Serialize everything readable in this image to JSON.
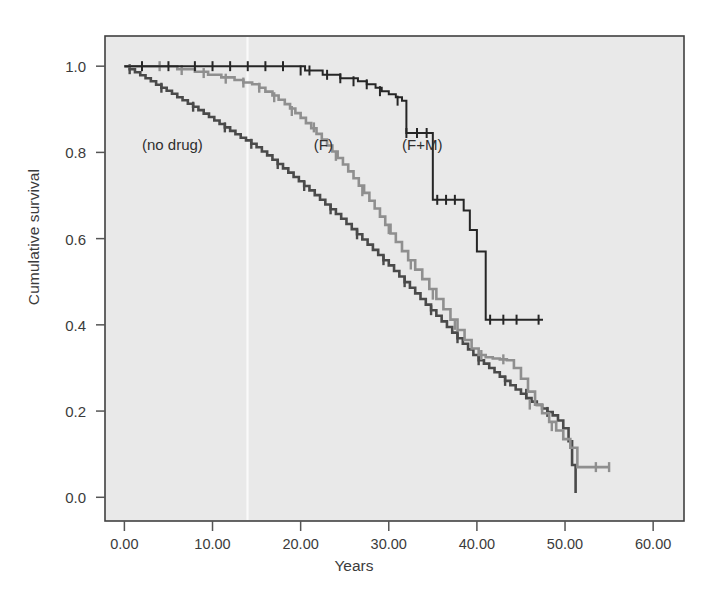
{
  "figure": {
    "axis_x_label": "Years",
    "axis_y_label": "Cumulative survival",
    "caption": "Fig. 12.2  Kaplan-Meier survival curves",
    "plot_background": "#e9e9e9",
    "border_color": "#404040"
  },
  "labels": {
    "no_drug": "(no drug)",
    "f": "(F)",
    "fm": "(F+M)"
  },
  "xticks": [
    "0.00",
    "10.00",
    "20.00",
    "30.00",
    "40.00",
    "50.00",
    "60.00"
  ],
  "yticks": [
    "1.0",
    "0.8",
    "0.6",
    "0.4",
    "0.2",
    "0.0"
  ],
  "chart_data": {
    "type": "line",
    "title": "",
    "subtitle": "",
    "xlabel": "Years",
    "ylabel": "Cumulative survival",
    "xlim": [
      -2.2,
      63.5
    ],
    "ylim": [
      -0.055,
      1.07
    ],
    "xticks": [
      0,
      10,
      20,
      30,
      40,
      50,
      60
    ],
    "xtick_labels": [
      "0.00",
      "10.00",
      "20.00",
      "30.00",
      "40.00",
      "50.00",
      "60.00"
    ],
    "yticks": [
      0.0,
      0.2,
      0.4,
      0.6,
      0.8,
      1.0
    ],
    "ytick_labels": [
      "0.0",
      "0.2",
      "0.4",
      "0.6",
      "0.8",
      "1.0"
    ],
    "grid": false,
    "legend": "inline-annotations",
    "step_style": "post",
    "series": [
      {
        "name": "(no drug)",
        "color": "#4a4a4a",
        "annotation_xy": [
          2.0,
          0.815
        ],
        "x": [
          0.0,
          0.6,
          1.2,
          1.8,
          2.4,
          3.0,
          3.6,
          4.2,
          4.8,
          5.4,
          6.0,
          6.6,
          7.2,
          7.8,
          8.4,
          9.0,
          9.6,
          10.2,
          10.8,
          11.4,
          12.0,
          12.6,
          13.2,
          13.8,
          14.4,
          15.0,
          15.6,
          16.2,
          16.8,
          17.4,
          18.0,
          18.6,
          19.2,
          19.8,
          20.4,
          21.0,
          21.6,
          22.2,
          22.8,
          23.4,
          24.0,
          24.6,
          25.2,
          25.8,
          26.4,
          27.0,
          27.6,
          28.2,
          28.8,
          29.4,
          30.0,
          30.6,
          31.2,
          31.8,
          32.4,
          33.0,
          33.6,
          34.2,
          34.8,
          35.4,
          36.0,
          36.6,
          37.2,
          37.8,
          38.4,
          39.0,
          39.6,
          40.2,
          40.8,
          41.4,
          42.0,
          42.6,
          43.2,
          43.8,
          44.4,
          45.0,
          45.6,
          46.2,
          46.8,
          47.4,
          48.0,
          48.6,
          49.2,
          49.8,
          50.4,
          50.8,
          51.2
        ],
        "y": [
          1.0,
          0.993,
          0.986,
          0.979,
          0.972,
          0.965,
          0.957,
          0.95,
          0.943,
          0.936,
          0.928,
          0.921,
          0.913,
          0.906,
          0.898,
          0.89,
          0.882,
          0.874,
          0.866,
          0.858,
          0.85,
          0.842,
          0.834,
          0.828,
          0.82,
          0.812,
          0.802,
          0.793,
          0.783,
          0.773,
          0.763,
          0.753,
          0.743,
          0.733,
          0.722,
          0.712,
          0.701,
          0.69,
          0.679,
          0.668,
          0.657,
          0.646,
          0.634,
          0.622,
          0.61,
          0.598,
          0.586,
          0.574,
          0.562,
          0.55,
          0.538,
          0.525,
          0.512,
          0.499,
          0.486,
          0.473,
          0.46,
          0.447,
          0.434,
          0.421,
          0.408,
          0.395,
          0.382,
          0.369,
          0.356,
          0.343,
          0.33,
          0.318,
          0.31,
          0.3,
          0.29,
          0.28,
          0.27,
          0.26,
          0.25,
          0.24,
          0.23,
          0.222,
          0.214,
          0.206,
          0.198,
          0.19,
          0.178,
          0.16,
          0.13,
          0.075,
          0.01
        ],
        "censor_x": [
          0.6,
          4.2,
          7.8,
          11.4,
          14.4,
          17.4,
          20.4,
          23.4,
          26.4,
          29.4,
          31.8,
          34.8,
          37.8,
          40.2,
          43.2,
          45.6,
          48.0
        ],
        "censor_y": [
          0.993,
          0.95,
          0.906,
          0.858,
          0.82,
          0.773,
          0.722,
          0.668,
          0.61,
          0.55,
          0.499,
          0.434,
          0.369,
          0.318,
          0.27,
          0.24,
          0.198
        ]
      },
      {
        "name": "(F)",
        "color": "#8f8f8f",
        "annotation_xy": [
          21.5,
          0.815
        ],
        "x": [
          0.0,
          4.0,
          6.0,
          8.0,
          9.5,
          11.0,
          12.5,
          13.5,
          14.5,
          15.3,
          16.0,
          16.8,
          17.5,
          18.2,
          18.8,
          19.4,
          20.0,
          20.6,
          21.2,
          21.8,
          22.4,
          23.0,
          23.6,
          24.2,
          24.8,
          25.4,
          26.0,
          26.6,
          27.2,
          27.8,
          28.4,
          29.0,
          29.6,
          30.2,
          30.8,
          31.5,
          32.2,
          33.0,
          33.8,
          34.6,
          35.4,
          36.2,
          37.0,
          37.8,
          38.6,
          39.4,
          40.2,
          41.0,
          41.8,
          42.6,
          43.4,
          44.2,
          45.0,
          45.8,
          46.6,
          47.4,
          48.2,
          49.0,
          49.8,
          50.6,
          51.4,
          55.0
        ],
        "y": [
          1.0,
          1.0,
          0.993,
          0.987,
          0.98,
          0.974,
          0.968,
          0.962,
          0.958,
          0.95,
          0.941,
          0.932,
          0.922,
          0.912,
          0.902,
          0.891,
          0.88,
          0.868,
          0.856,
          0.843,
          0.83,
          0.816,
          0.802,
          0.787,
          0.772,
          0.756,
          0.74,
          0.723,
          0.706,
          0.688,
          0.67,
          0.651,
          0.632,
          0.612,
          0.592,
          0.571,
          0.55,
          0.528,
          0.506,
          0.483,
          0.46,
          0.436,
          0.412,
          0.388,
          0.365,
          0.345,
          0.33,
          0.325,
          0.322,
          0.32,
          0.318,
          0.3,
          0.275,
          0.245,
          0.215,
          0.195,
          0.175,
          0.155,
          0.135,
          0.115,
          0.07,
          0.07
        ],
        "censor_x": [
          4.0,
          6.5,
          9.0,
          11.5,
          13.5,
          15.3,
          17.0,
          19.0,
          21.5,
          24.0,
          27.0,
          30.0,
          32.5,
          35.0,
          37.5,
          40.5,
          43.0,
          46.0,
          48.5,
          53.5,
          55.0
        ],
        "censor_y": [
          1.0,
          0.991,
          0.984,
          0.971,
          0.962,
          0.95,
          0.928,
          0.896,
          0.858,
          0.792,
          0.71,
          0.622,
          0.54,
          0.47,
          0.4,
          0.33,
          0.32,
          0.215,
          0.165,
          0.07,
          0.07
        ]
      },
      {
        "name": "(F+M)",
        "color": "#262626",
        "annotation_xy": [
          31.5,
          0.815
        ],
        "x": [
          0.0,
          5.0,
          8.0,
          11.0,
          13.0,
          15.0,
          17.0,
          19.0,
          20.5,
          21.5,
          22.5,
          23.5,
          24.5,
          25.5,
          26.5,
          27.5,
          28.5,
          29.2,
          30.0,
          30.8,
          31.5,
          32.0,
          32.5,
          33.0,
          33.5,
          34.0,
          35.0,
          36.0,
          37.0,
          37.8,
          38.5,
          39.2,
          40.0,
          41.0,
          43.0,
          45.0,
          47.5
        ],
        "y": [
          1.0,
          1.0,
          1.0,
          1.0,
          1.0,
          1.0,
          1.0,
          1.0,
          0.99,
          0.99,
          0.98,
          0.98,
          0.972,
          0.972,
          0.965,
          0.958,
          0.95,
          0.942,
          0.935,
          0.928,
          0.92,
          0.845,
          0.845,
          0.845,
          0.845,
          0.845,
          0.69,
          0.69,
          0.69,
          0.69,
          0.665,
          0.62,
          0.57,
          0.412,
          0.412,
          0.412,
          0.412
        ],
        "censor_x": [
          2.0,
          5.0,
          8.0,
          10.0,
          12.0,
          14.0,
          16.0,
          18.0,
          20.0,
          21.0,
          23.0,
          24.5,
          26.0,
          27.5,
          29.0,
          31.0,
          32.0,
          33.2,
          34.3,
          35.5,
          36.5,
          37.5,
          41.5,
          43.0,
          44.5,
          47.0
        ],
        "censor_y": [
          1.0,
          1.0,
          1.0,
          1.0,
          1.0,
          1.0,
          1.0,
          1.0,
          0.99,
          0.99,
          0.98,
          0.972,
          0.965,
          0.958,
          0.942,
          0.92,
          0.845,
          0.845,
          0.845,
          0.69,
          0.69,
          0.69,
          0.412,
          0.412,
          0.412,
          0.412
        ]
      }
    ]
  }
}
